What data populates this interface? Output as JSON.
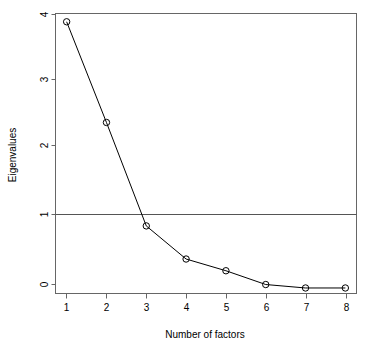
{
  "chart_data": {
    "type": "line",
    "title": "",
    "subtitle": "",
    "xlabel": "Number of factors",
    "ylabel": "Eigenvalues",
    "x": [
      1,
      2,
      3,
      4,
      5,
      6,
      7,
      8
    ],
    "values": [
      3.88,
      2.42,
      0.92,
      0.44,
      0.27,
      0.07,
      0.02,
      0.02
    ],
    "series": [
      {
        "name": "Eigenvalues",
        "values": [
          3.88,
          2.42,
          0.92,
          0.44,
          0.27,
          0.07,
          0.02,
          0.02
        ]
      }
    ],
    "xlim": [
      0.72,
      8.28
    ],
    "ylim": [
      -0.06,
      4.0
    ],
    "xticks": [
      1,
      2,
      3,
      4,
      5,
      6,
      7,
      8
    ],
    "xtick_labels": [
      "1",
      "2",
      "3",
      "4",
      "5",
      "6",
      "7",
      "8"
    ],
    "yticks": [
      0,
      1,
      2,
      3,
      4
    ],
    "ytick_labels": [
      "0",
      "1",
      "2",
      "3",
      "4"
    ],
    "grid": false,
    "legend": false,
    "legend_position": "none",
    "annotations": [
      {
        "kind": "horizontal-reference-line",
        "y": 1,
        "label": ""
      }
    ],
    "marker": "open-circle",
    "line_color": "#000000",
    "marker_color": "#000000",
    "box_color": "#666666",
    "background_color": "#ffffff"
  },
  "axes": {
    "x_title": "Number of factors",
    "y_title": "Eigenvalues",
    "x_tick_labels": [
      "1",
      "2",
      "3",
      "4",
      "5",
      "6",
      "7",
      "8"
    ],
    "y_tick_labels": [
      "0",
      "1",
      "2",
      "3",
      "4"
    ]
  }
}
